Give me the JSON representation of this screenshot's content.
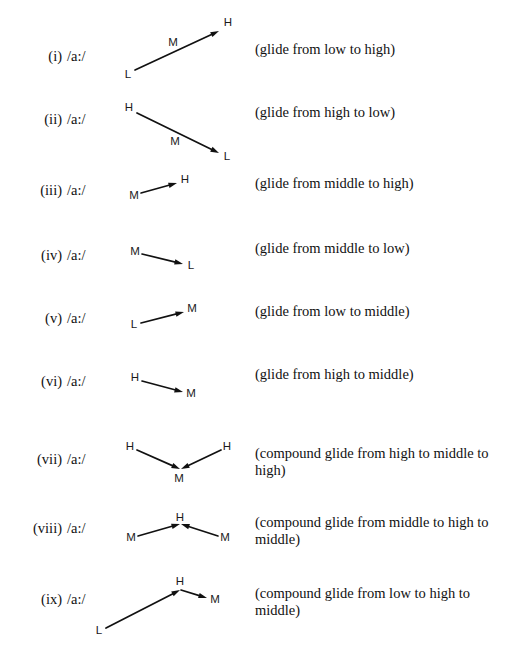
{
  "figure": {
    "tone_levels": {
      "high": "H",
      "middle": "M",
      "low": "L"
    },
    "line_color": "#111111",
    "text_color": "#111111",
    "rows": [
      {
        "number": "(i)",
        "vowel": "/a:/",
        "description": "(glide from low to high)",
        "tones": [
          "L",
          "M",
          "H"
        ],
        "tone_marks": [
          {
            "label": "L",
            "x": 128,
            "y": 75
          },
          {
            "label": "M",
            "x": 173,
            "y": 43
          },
          {
            "label": "H",
            "x": 228,
            "y": 23
          }
        ],
        "arrows": [
          {
            "x1": 135,
            "y1": 70,
            "x2": 219,
            "y2": 31
          }
        ],
        "label_y": 56,
        "desc_y": 48
      },
      {
        "number": "(ii)",
        "vowel": "/a:/",
        "description": "(glide from high to low)",
        "tones": [
          "H",
          "M",
          "L"
        ],
        "tone_marks": [
          {
            "label": "H",
            "x": 129,
            "y": 108
          },
          {
            "label": "M",
            "x": 175,
            "y": 142
          },
          {
            "label": "L",
            "x": 227,
            "y": 157
          }
        ],
        "arrows": [
          {
            "x1": 137,
            "y1": 113,
            "x2": 219,
            "y2": 153
          }
        ],
        "label_y": 119,
        "desc_y": 111
      },
      {
        "number": "(iii)",
        "vowel": "/a:/",
        "description": "(glide from middle to high)",
        "tones": [
          "M",
          "H"
        ],
        "tone_marks": [
          {
            "label": "M",
            "x": 134,
            "y": 196
          },
          {
            "label": "H",
            "x": 185,
            "y": 180
          }
        ],
        "arrows": [
          {
            "x1": 141,
            "y1": 193,
            "x2": 177,
            "y2": 183
          }
        ],
        "label_y": 190,
        "desc_y": 182
      },
      {
        "number": "(iv)",
        "vowel": "/a:/",
        "description": "(glide from middle to low)",
        "tones": [
          "M",
          "L"
        ],
        "tone_marks": [
          {
            "label": "M",
            "x": 135,
            "y": 252
          },
          {
            "label": "L",
            "x": 191,
            "y": 266
          }
        ],
        "arrows": [
          {
            "x1": 142,
            "y1": 254,
            "x2": 183,
            "y2": 264
          }
        ],
        "label_y": 255,
        "desc_y": 247
      },
      {
        "number": "(v)",
        "vowel": "/a:/",
        "description": "(glide from low to middle)",
        "tones": [
          "L",
          "M"
        ],
        "tone_marks": [
          {
            "label": "L",
            "x": 134,
            "y": 325
          },
          {
            "label": "M",
            "x": 192,
            "y": 309
          },
          {
            "label": "",
            "x": 0,
            "y": 0
          }
        ],
        "arrows": [
          {
            "x1": 141,
            "y1": 323,
            "x2": 184,
            "y2": 312
          }
        ],
        "label_y": 318,
        "desc_y": 310
      },
      {
        "number": "(vi)",
        "vowel": "/a:/",
        "description": "(glide from high to middle)",
        "tones": [
          "H",
          "M"
        ],
        "tone_marks": [
          {
            "label": "H",
            "x": 135,
            "y": 378
          },
          {
            "label": "M",
            "x": 191,
            "y": 394
          }
        ],
        "arrows": [
          {
            "x1": 142,
            "y1": 381,
            "x2": 183,
            "y2": 392
          }
        ],
        "label_y": 381,
        "desc_y": 373
      },
      {
        "number": "(vii)",
        "vowel": "/a:/",
        "description": "(compound glide from high to middle to high)",
        "tones": [
          "H",
          "M",
          "H"
        ],
        "tone_marks": [
          {
            "label": "H",
            "x": 130,
            "y": 447
          },
          {
            "label": "M",
            "x": 179,
            "y": 479
          },
          {
            "label": "H",
            "x": 227,
            "y": 447
          }
        ],
        "arrows": [
          {
            "x1": 137,
            "y1": 450,
            "x2": 180,
            "y2": 469
          },
          {
            "x1": 221,
            "y1": 450,
            "x2": 181,
            "y2": 469
          }
        ],
        "label_y": 459,
        "desc_y": 452
      },
      {
        "number": "(viii)",
        "vowel": "/a:/",
        "description": "(compound glide from middle to high to middle)",
        "tones": [
          "M",
          "H",
          "M"
        ],
        "tone_marks": [
          {
            "label": "M",
            "x": 131,
            "y": 538
          },
          {
            "label": "H",
            "x": 180,
            "y": 518
          },
          {
            "label": "M",
            "x": 225,
            "y": 538
          }
        ],
        "arrows": [
          {
            "x1": 138,
            "y1": 536,
            "x2": 180,
            "y2": 524
          },
          {
            "x1": 218,
            "y1": 536,
            "x2": 181,
            "y2": 524
          }
        ],
        "label_y": 528,
        "desc_y": 521
      },
      {
        "number": "(ix)",
        "vowel": "/a:/",
        "description": "(compound glide from low to high to middle)",
        "tones": [
          "L",
          "H",
          "M"
        ],
        "tone_marks": [
          {
            "label": "H",
            "x": 180,
            "y": 582
          },
          {
            "label": "M",
            "x": 215,
            "y": 600
          },
          {
            "label": "L",
            "x": 99,
            "y": 631
          }
        ],
        "arrows": [
          {
            "x1": 106,
            "y1": 628,
            "x2": 180,
            "y2": 590
          },
          {
            "x1": 181,
            "y1": 590,
            "x2": 207,
            "y2": 598
          }
        ],
        "label_y": 599,
        "desc_y": 592
      }
    ]
  }
}
